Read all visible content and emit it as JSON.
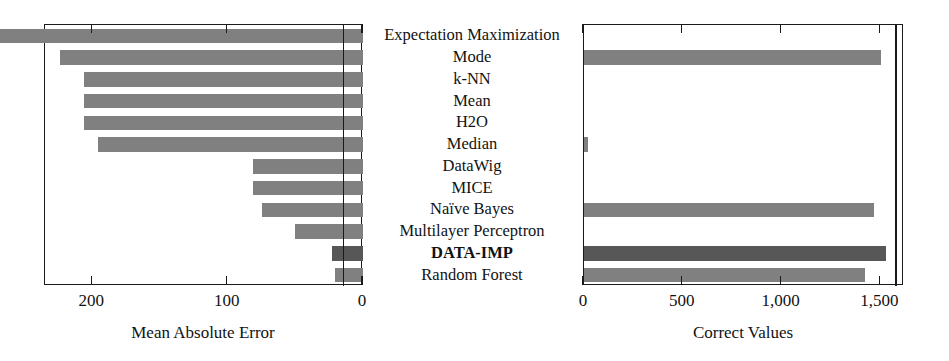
{
  "figure": {
    "categories": [
      "Expectation Maximization",
      "Mode",
      "k-NN",
      "Mean",
      "H2O",
      "Median",
      "DataWig",
      "MICE",
      "Naïve Bayes",
      "Multilayer Perceptron",
      "DATA-IMP",
      "Random Forest"
    ],
    "highlight_category": "DATA-IMP",
    "bar_color": "#808080",
    "highlight_bar_color": "#575757",
    "axis_color": "#1a1a1a"
  },
  "chart_data": [
    {
      "type": "bar",
      "orientation": "horizontal",
      "panel": "left",
      "title": "",
      "xlabel": "Mean Absolute Error",
      "ylabel": "",
      "x_reversed": true,
      "xlim": [
        0,
        235
      ],
      "xticks": [
        200,
        100,
        0
      ],
      "xtick_labels": [
        "200",
        "100",
        "0"
      ],
      "grid": false,
      "reference_line": 15,
      "categories": [
        "Expectation Maximization",
        "Mode",
        "k-NN",
        "Mean",
        "H2O",
        "Median",
        "DataWig",
        "MICE",
        "Naïve Bayes",
        "Multilayer Perceptron",
        "DATA-IMP",
        "Random Forest"
      ],
      "values": [
        290,
        224,
        206,
        206,
        206,
        196,
        81,
        81,
        75,
        50,
        23,
        21
      ]
    },
    {
      "type": "bar",
      "orientation": "horizontal",
      "panel": "right",
      "title": "",
      "xlabel": "Correct Values",
      "ylabel": "",
      "x_reversed": false,
      "xlim": [
        0,
        1620
      ],
      "xticks": [
        0,
        500,
        1000,
        1500
      ],
      "xtick_labels": [
        "0",
        "500",
        "1,000",
        "1,500"
      ],
      "grid": false,
      "reference_line": 1575,
      "categories": [
        "Expectation Maximization",
        "Mode",
        "k-NN",
        "Mean",
        "H2O",
        "Median",
        "DataWig",
        "MICE",
        "Naïve Bayes",
        "Multilayer Perceptron",
        "DATA-IMP",
        "Random Forest"
      ],
      "values": [
        0,
        1505,
        0,
        0,
        0,
        22,
        0,
        0,
        1470,
        0,
        1530,
        1425
      ]
    }
  ]
}
